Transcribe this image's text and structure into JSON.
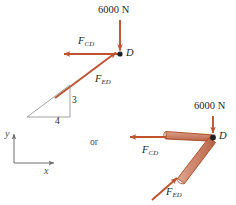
{
  "figure": {
    "title_text": "",
    "colors": {
      "force_arrow": "#c0522d",
      "member_fill": "#cf8a74",
      "member_edge": "#b4532c",
      "text": "#231f20",
      "thin_line": "#7a7a7a",
      "background": "#ffffff"
    },
    "connector_text": "or"
  },
  "left_diagram": {
    "name": "particle-free-body-diagram",
    "joint_label": "D",
    "applied_load": {
      "label": "6000 N",
      "direction": "down"
    },
    "forces": [
      {
        "id": "FCD",
        "base": "F",
        "sub": "CD",
        "direction": "left"
      },
      {
        "id": "FED",
        "base": "F",
        "sub": "ED",
        "direction": "up-right-3-4"
      }
    ],
    "slope_triangle": {
      "rise_label": "3",
      "run_label": "4"
    }
  },
  "axes": {
    "y_label": "y",
    "x_label": "x"
  },
  "right_diagram": {
    "name": "member-free-body-diagram",
    "joint_label": "D",
    "applied_load": {
      "label": "6000 N",
      "direction": "down"
    },
    "forces": [
      {
        "id": "FCD",
        "base": "F",
        "sub": "CD",
        "direction": "left"
      },
      {
        "id": "FED",
        "base": "F",
        "sub": "ED",
        "direction": "up-right-3-4"
      }
    ],
    "members": [
      {
        "id": "CD",
        "orientation": "horizontal"
      },
      {
        "id": "ED",
        "orientation": "diagonal"
      }
    ]
  }
}
